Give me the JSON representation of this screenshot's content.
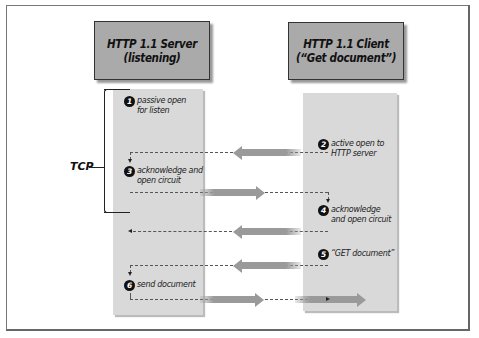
{
  "diagram": {
    "server": {
      "title_line1": "HTTP 1.1 Server",
      "title_line2": "(listening)"
    },
    "client": {
      "title_line1": "HTTP 1.1 Client",
      "title_line2": "(“Get document”)"
    },
    "bracket_label": "TCP",
    "steps": [
      {
        "num": "1",
        "line1": "passive open",
        "line2": "for listen",
        "side": "server"
      },
      {
        "num": "2",
        "line1": "active open to",
        "line2": "HTTP server",
        "side": "client"
      },
      {
        "num": "3",
        "line1": "acknowledge and",
        "line2": "open circuit",
        "side": "server"
      },
      {
        "num": "4",
        "line1": "acknowledge",
        "line2": "and open circuit",
        "side": "client"
      },
      {
        "num": "5",
        "line1": "“GET document”",
        "line2": "",
        "side": "client"
      },
      {
        "num": "6",
        "line1": "send document",
        "line2": "",
        "side": "server"
      }
    ],
    "arrows": [
      {
        "from": "client",
        "to": "server",
        "step": "2"
      },
      {
        "from": "server",
        "to": "client",
        "step": "3"
      },
      {
        "from": "client",
        "to": "server",
        "step": "4"
      },
      {
        "from": "client",
        "to": "server",
        "step": "5"
      },
      {
        "from": "server",
        "to": "client",
        "step": "6"
      }
    ],
    "colors": {
      "header_fill": "#aaaaaa",
      "lane_fill": "#d9d9d9",
      "arrow_fill": "#9a9a9a"
    }
  }
}
